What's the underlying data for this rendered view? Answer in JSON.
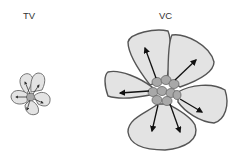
{
  "labels": {
    "left": "TV",
    "right": "VC"
  },
  "colors": {
    "petal_fill": "#e3e3e3",
    "petal_stroke": "#555555",
    "center_fill": "#a8a8a8",
    "arrow": "#111111"
  },
  "figures": [
    {
      "name": "TV",
      "description": "small flower-like cluster with 5 petals, central cell cluster and 6 outward arrows"
    },
    {
      "name": "VC",
      "description": "large flower-like cluster with 5 petals, central cell cluster and 6 outward arrows"
    }
  ]
}
